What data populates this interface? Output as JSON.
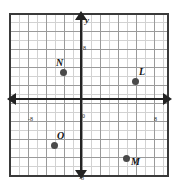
{
  "figure": {
    "kind": "coordinate-plane",
    "axes": {
      "x_label": "x",
      "y_label": "y",
      "origin_label": "0",
      "x_tick_negative": "-8",
      "x_tick_positive": "8",
      "y_tick_positive": "8",
      "y_tick_negative": "-8"
    },
    "points": [
      {
        "label": "N",
        "x": -3,
        "y": 5
      },
      {
        "label": "L",
        "x": 4,
        "y": 4
      },
      {
        "label": "O",
        "x": -4,
        "y": -4
      },
      {
        "label": "M",
        "x": 3,
        "y": -5
      }
    ],
    "colors": {
      "grid_minor": "#d2d2d2",
      "grid_major": "#9a9a9a",
      "border": "#3a3a3a",
      "axis": "#232323",
      "point": "#4a4a4a"
    }
  },
  "chart_data": {
    "type": "scatter",
    "title": "",
    "xlabel": "x",
    "ylabel": "y",
    "xlim": [
      -9,
      9
    ],
    "ylim": [
      -9,
      9
    ],
    "grid": true,
    "legend": "none",
    "xticks": [
      "-8",
      "0",
      "8"
    ],
    "yticks": [
      "-8",
      "0",
      "8"
    ],
    "series": [
      {
        "name": "labeled-points",
        "points": [
          {
            "label": "N",
            "x": -3,
            "y": 5
          },
          {
            "label": "L",
            "x": 4,
            "y": 4
          },
          {
            "label": "O",
            "x": -4,
            "y": -4
          },
          {
            "label": "M",
            "x": 3,
            "y": -5
          }
        ]
      }
    ]
  }
}
